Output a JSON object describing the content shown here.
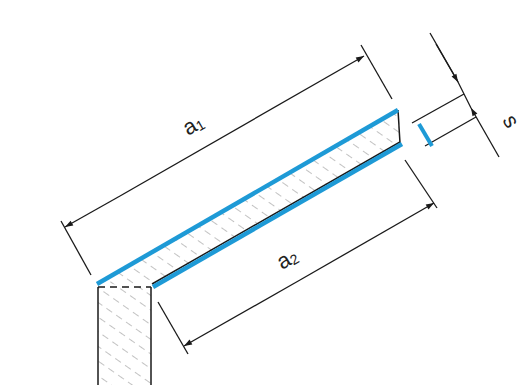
{
  "diagram": {
    "type": "technical-section-drawing",
    "colors": {
      "line": "#1a1a1a",
      "highlight": "#1e9ad6",
      "hatch": "#555555",
      "background": "#ffffff"
    },
    "labels": {
      "a1": {
        "main": "a",
        "sub": "1"
      },
      "a2": {
        "main": "a",
        "sub": "2"
      },
      "s": {
        "main": "s"
      }
    },
    "dimensions": [
      {
        "name": "a1",
        "description": "upper (outer) length along top surface"
      },
      {
        "name": "a2",
        "description": "lower (inner) length along bottom surface"
      },
      {
        "name": "s",
        "description": "slab thickness"
      }
    ]
  }
}
